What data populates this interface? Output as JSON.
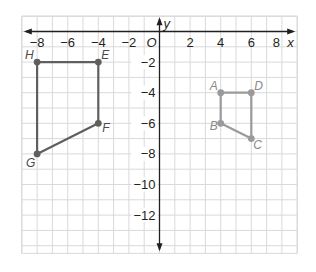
{
  "chart_data": {
    "type": "scatter",
    "title": "",
    "xlabel": "x",
    "ylabel": "y",
    "origin_label": "O",
    "xlim": [
      -9,
      9
    ],
    "ylim": [
      -14.5,
      1
    ],
    "grid": true,
    "x_ticks": [
      -8,
      -6,
      -4,
      -2,
      2,
      4,
      6,
      8
    ],
    "y_ticks": [
      -2,
      -4,
      -6,
      -8,
      -10,
      -12
    ],
    "x_tick_labels": [
      "−8",
      "−6",
      "−4",
      "−2",
      "2",
      "4",
      "6",
      "8"
    ],
    "y_tick_labels": [
      "−2",
      "−4",
      "−6",
      "−8",
      "−10",
      "−12"
    ],
    "series": [
      {
        "name": "ABCD",
        "color": "#9a9a9a",
        "closed": false,
        "path": [
          "D",
          "A",
          "B",
          "C",
          "D"
        ],
        "points": [
          {
            "label": "A",
            "x": 4,
            "y": -4
          },
          {
            "label": "B",
            "x": 4,
            "y": -6
          },
          {
            "label": "C",
            "x": 6,
            "y": -7
          },
          {
            "label": "D",
            "x": 6,
            "y": -4
          }
        ]
      },
      {
        "name": "EFGH",
        "color": "#5f5f5f",
        "closed": true,
        "path": [
          "H",
          "E",
          "F",
          "G",
          "H"
        ],
        "points": [
          {
            "label": "E",
            "x": -4,
            "y": -2
          },
          {
            "label": "F",
            "x": -4,
            "y": -6
          },
          {
            "label": "G",
            "x": -8,
            "y": -8
          },
          {
            "label": "H",
            "x": -8,
            "y": -2
          }
        ]
      }
    ]
  },
  "colors": {
    "grid": "#d9d9d9",
    "axis": "#231f20",
    "text": "#231f20"
  }
}
